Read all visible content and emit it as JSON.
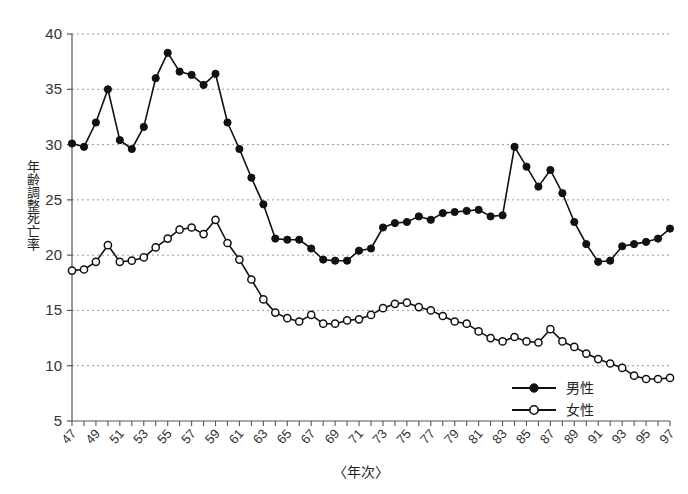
{
  "chart_data": {
    "type": "line",
    "title": "",
    "xlabel": "〈年次〉",
    "ylabel": "年齢調整死亡率",
    "xlim": [
      47,
      97
    ],
    "ylim": [
      5,
      40
    ],
    "yticks": [
      5,
      10,
      15,
      20,
      25,
      30,
      35,
      40
    ],
    "ytick_labels": [
      "5",
      "10",
      "15",
      "20",
      "25",
      "30",
      "35",
      "40"
    ],
    "grid": "horizontal-dashed",
    "legend_position": "bottom-right",
    "x": [
      47,
      48,
      49,
      50,
      51,
      52,
      53,
      54,
      55,
      56,
      57,
      58,
      59,
      60,
      61,
      62,
      63,
      64,
      65,
      66,
      67,
      68,
      69,
      70,
      71,
      72,
      73,
      74,
      75,
      76,
      77,
      78,
      79,
      80,
      81,
      82,
      83,
      84,
      85,
      86,
      87,
      88,
      89,
      90,
      91,
      92,
      93,
      94,
      95,
      96,
      97
    ],
    "xtick_labels": [
      "47",
      "49",
      "51",
      "53",
      "55",
      "57",
      "59",
      "61",
      "63",
      "65",
      "67",
      "69",
      "71",
      "73",
      "75",
      "77",
      "79",
      "81",
      "83",
      "85",
      "87",
      "89",
      "91",
      "93",
      "95",
      "97"
    ],
    "series": [
      {
        "name": "男性",
        "marker": "filled-circle",
        "color": "#111111",
        "values": [
          30.1,
          29.8,
          32.0,
          35.0,
          30.4,
          29.6,
          31.6,
          36.0,
          38.3,
          36.6,
          36.3,
          35.4,
          36.4,
          32.0,
          29.6,
          27.0,
          24.6,
          21.5,
          21.4,
          21.4,
          20.6,
          19.6,
          19.5,
          19.5,
          20.4,
          20.6,
          22.5,
          22.9,
          23.0,
          23.5,
          23.2,
          23.8,
          23.9,
          24.0,
          24.1,
          23.5,
          23.6,
          29.8,
          28.0,
          26.2,
          27.7,
          25.6,
          23.0,
          21.0,
          19.4,
          19.5,
          20.8,
          21.0,
          21.2,
          21.5,
          22.4
        ]
      },
      {
        "name": "女性",
        "marker": "open-circle",
        "color": "#111111",
        "values": [
          18.6,
          18.7,
          19.4,
          20.9,
          19.4,
          19.5,
          19.8,
          20.7,
          21.5,
          22.3,
          22.5,
          21.9,
          23.2,
          21.1,
          19.6,
          17.8,
          16.0,
          14.8,
          14.3,
          14.0,
          14.6,
          13.8,
          13.8,
          14.1,
          14.2,
          14.6,
          15.2,
          15.6,
          15.7,
          15.3,
          15.0,
          14.5,
          14.0,
          13.8,
          13.1,
          12.5,
          12.2,
          12.6,
          12.2,
          12.1,
          13.3,
          12.2,
          11.7,
          11.1,
          10.6,
          10.2,
          9.8,
          9.1,
          8.8,
          8.8,
          8.9
        ]
      }
    ]
  },
  "legend": {
    "items": [
      {
        "label": "男性"
      },
      {
        "label": "女性"
      }
    ]
  },
  "axes": {
    "y_title": "年齢調整死亡率",
    "x_title": "〈年次〉"
  }
}
